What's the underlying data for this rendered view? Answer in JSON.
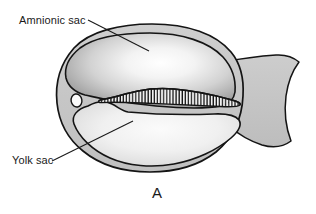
{
  "figure": {
    "panel_letter": "A",
    "labels": [
      {
        "id": "amnionic_sac",
        "text": "Amnionic sac"
      },
      {
        "id": "yolk_sac",
        "text": "Yolk sac"
      }
    ],
    "colors": {
      "background": "#ffffff",
      "outline": "#141414",
      "outer_shell_fill": "#c9c9c9",
      "amnion_fill_edge": "#8e8e8e",
      "amnion_fill_center": "#fbfbfb",
      "yolk_fill_edge": "#d2d2d2",
      "yolk_fill_center": "#f2f2f2",
      "tail_fill": "#c6c6c6",
      "vesicle_fill": "#fafafa",
      "somite_stripe": "#1c1c1c",
      "label_text": "#1a1a1a",
      "leader_line": "#1a1a1a"
    },
    "structures": [
      {
        "id": "outer_shell",
        "name": "chorionic-shell"
      },
      {
        "id": "amnionic_sac",
        "name": "amnionic-sac-cavity"
      },
      {
        "id": "yolk_sac",
        "name": "yolk-sac-cavity"
      },
      {
        "id": "embryo",
        "name": "embryo-somite-band"
      },
      {
        "id": "vesicle",
        "name": "small-vesicle"
      },
      {
        "id": "tail",
        "name": "tail-extension"
      }
    ],
    "somite_count": 44
  }
}
